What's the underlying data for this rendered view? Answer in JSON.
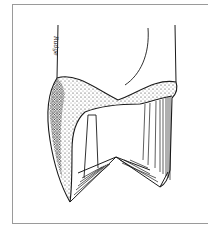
{
  "figure": {
    "signature": "Rudge",
    "colors": {
      "line": "#1a1a1a",
      "frame": "#9a9a9a",
      "background": "#ffffff"
    }
  }
}
